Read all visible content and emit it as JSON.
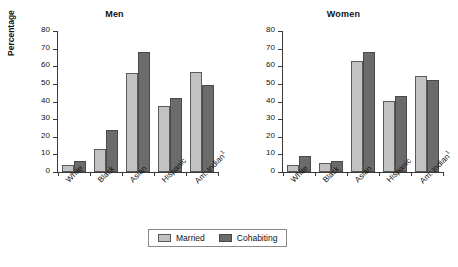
{
  "chart_data": {
    "type": "bar",
    "title": "",
    "ylabel": "Percentage",
    "xlabel": "",
    "ylim": [
      0,
      80
    ],
    "yticks": [
      0,
      10,
      20,
      30,
      40,
      50,
      60,
      70,
      80
    ],
    "ytick_labels": [
      "0",
      "10",
      "20",
      "30",
      "40",
      "50",
      "60",
      "70",
      "80"
    ],
    "grid": false,
    "legend_position": "bottom-center",
    "legend_entries": [
      "Married",
      "Cohabiting"
    ],
    "categories": [
      "White",
      "Black",
      "Asian",
      "Hispanic",
      "Am. Indian"
    ],
    "category_footnotes": [
      "",
      "",
      "",
      "",
      "1"
    ],
    "panels": [
      {
        "title": "Men",
        "series": [
          {
            "name": "Married",
            "values": [
              4,
              13,
              56,
              37.5,
              56.5
            ]
          },
          {
            "name": "Cohabiting",
            "values": [
              6,
              24,
              68,
              42,
              49.5
            ]
          }
        ]
      },
      {
        "title": "Women",
        "series": [
          {
            "name": "Married",
            "values": [
              4,
              5,
              63,
              40.5,
              54.5
            ]
          },
          {
            "name": "Cohabiting",
            "values": [
              9,
              6,
              68,
              43,
              52
            ]
          }
        ]
      }
    ]
  },
  "colors": {
    "married": "#c2c2c2",
    "cohabiting": "#6b6b6b",
    "axis": "#3a3a3a",
    "background": "#ffffff"
  },
  "legend": {
    "married_label": "Married",
    "cohabiting_label": "Cohabiting"
  },
  "panel_men": {
    "title": "Men",
    "ylabel": "Percentage"
  },
  "panel_women": {
    "title": "Women"
  }
}
